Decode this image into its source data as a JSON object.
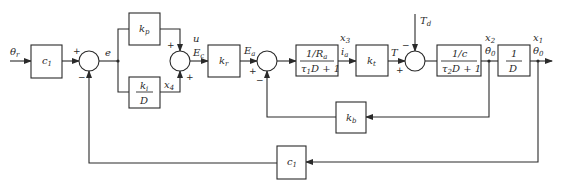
{
  "diagram": {
    "type": "control-system-block-diagram",
    "input": {
      "symbol": "θ",
      "sub": "r"
    },
    "blocks": {
      "c1_forward": {
        "main": "c",
        "sub": "1"
      },
      "kp": {
        "main": "k",
        "sub": "p"
      },
      "ki_over_D": {
        "num_main": "k",
        "num_sub": "i",
        "den": "D"
      },
      "kr": {
        "main": "k",
        "sub": "r"
      },
      "armature": {
        "num_main": "1/R",
        "num_sub": "a",
        "den_pre": "τ",
        "den_sub": "1",
        "den_post": "D + 1"
      },
      "kt": {
        "main": "k",
        "sub": "t"
      },
      "load": {
        "num": "1/c",
        "den_pre": "τ",
        "den_sub": "2",
        "den_post": "D + 1"
      },
      "integrator": {
        "num": "1",
        "den": "D"
      },
      "kb": {
        "main": "k",
        "sub": "b"
      },
      "c1_feedback": {
        "main": "c",
        "sub": "1"
      }
    },
    "signals": {
      "e": "e",
      "u": "u",
      "Ec": {
        "main": "E",
        "sub": "c"
      },
      "x4": {
        "main": "x",
        "sub": "4"
      },
      "Ea": {
        "main": "E",
        "sub": "a"
      },
      "x3": {
        "main": "x",
        "sub": "3"
      },
      "ia": {
        "main": "i",
        "sub": "a"
      },
      "T": "T",
      "Td": {
        "main": "T",
        "sub": "d"
      },
      "x2": {
        "main": "x",
        "sub": "2"
      },
      "theta0_dot": {
        "main": "θ̇",
        "sub": "0"
      },
      "x1": {
        "main": "x",
        "sub": "1"
      },
      "theta0": {
        "main": "θ",
        "sub": "0"
      }
    },
    "summing_junctions": [
      {
        "id": "sum1",
        "signs": {
          "left": "+",
          "bottom": "−"
        }
      },
      {
        "id": "sum2",
        "signs": {
          "top": "+",
          "bottom": "+"
        }
      },
      {
        "id": "sum3",
        "signs": {
          "left": "+",
          "bottom": "−"
        }
      },
      {
        "id": "sum4",
        "signs": {
          "left": "+",
          "top": "−"
        }
      }
    ]
  }
}
